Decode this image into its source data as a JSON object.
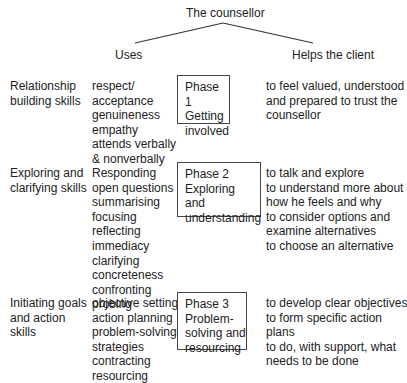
{
  "root": {
    "label": "The counsellor"
  },
  "branches": {
    "left": "Uses",
    "right": "Helps the client"
  },
  "rows": [
    {
      "skill_group": [
        "Relationship",
        "building skills"
      ],
      "uses": [
        "respect/",
        "acceptance",
        "genuineness",
        "empathy",
        "attends verbally",
        "& nonverbally"
      ],
      "phase": [
        "Phase 1",
        "Getting",
        "involved"
      ],
      "helps": [
        "to feel valued, understood",
        "and prepared to trust the",
        "counsellor"
      ]
    },
    {
      "skill_group": [
        "Exploring and",
        "clarifying skills"
      ],
      "uses": [
        "Responding",
        "open questions",
        "summarising",
        "focusing",
        "reflecting",
        "immediacy",
        "clarifying",
        "concreteness",
        "confronting",
        "probing"
      ],
      "phase": [
        "Phase 2",
        "Exploring",
        "and",
        "understanding"
      ],
      "helps": [
        "to talk and explore",
        "to understand more about",
        "how he feels and why",
        "to consider options and",
        "examine alternatives",
        "to choose an alternative"
      ]
    },
    {
      "skill_group": [
        "Initiating goals",
        "and action",
        "skills"
      ],
      "uses": [
        "objective setting",
        "action planning",
        "problem-solving",
        "strategies",
        "contracting",
        "resourcing"
      ],
      "phase": [
        "Phase 3",
        "Problem-",
        "solving and",
        "resourcing"
      ],
      "helps": [
        "to develop clear objectives",
        "to form specific action",
        "plans",
        "to do, with support, what",
        "needs to be done"
      ]
    }
  ]
}
